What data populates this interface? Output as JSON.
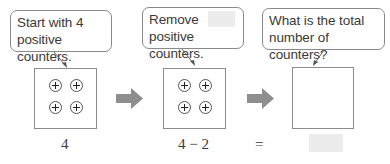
{
  "steps": [
    {
      "bubble_line1": "Start with 4",
      "bubble_line2": "positive counters.",
      "counter_count": 4,
      "expression": "4"
    },
    {
      "bubble_line1": "Remove",
      "bubble_blank": "",
      "bubble_line2": "positive counters.",
      "counter_count": 4,
      "expression": "4 − 2"
    },
    {
      "bubble_line1": "What is the total",
      "bubble_line2": "number of counters?",
      "counter_count": 0,
      "expression": ""
    }
  ],
  "equals_sign": "=",
  "answer": "",
  "colors": {
    "arrow": "#8e8e8e",
    "blank": "#ececec",
    "border": "#8c8c8c"
  },
  "counter_symbol": "plus",
  "icons": [
    "right-arrow-icon",
    "right-arrow-icon"
  ]
}
